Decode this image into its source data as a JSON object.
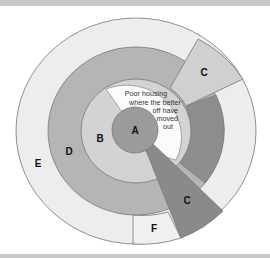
{
  "diagram": {
    "type": "concentric-zone-model",
    "colors": {
      "zone_e": "#ededed",
      "zone_d": "#b5b5b5",
      "zone_d_dark": "#8d8d8d",
      "zone_b": "#d3d3d3",
      "zone_a": "#9b9b9b",
      "zone_c_upper": "#d0d0d0",
      "zone_c_lower": "#8a8a8a",
      "zone_f": "#f0f0f0",
      "poor_housing": "#fbfbfb",
      "outline": "#767676",
      "frame_bar": "#c8c8c8"
    },
    "labels": {
      "a": "A",
      "b": "B",
      "c_upper": "C",
      "c_lower": "C",
      "d": "D",
      "e": "E",
      "f": "F"
    },
    "annotation": {
      "lines": [
        "Poor housing",
        "where the better",
        "off have",
        "moved",
        "out"
      ]
    }
  }
}
